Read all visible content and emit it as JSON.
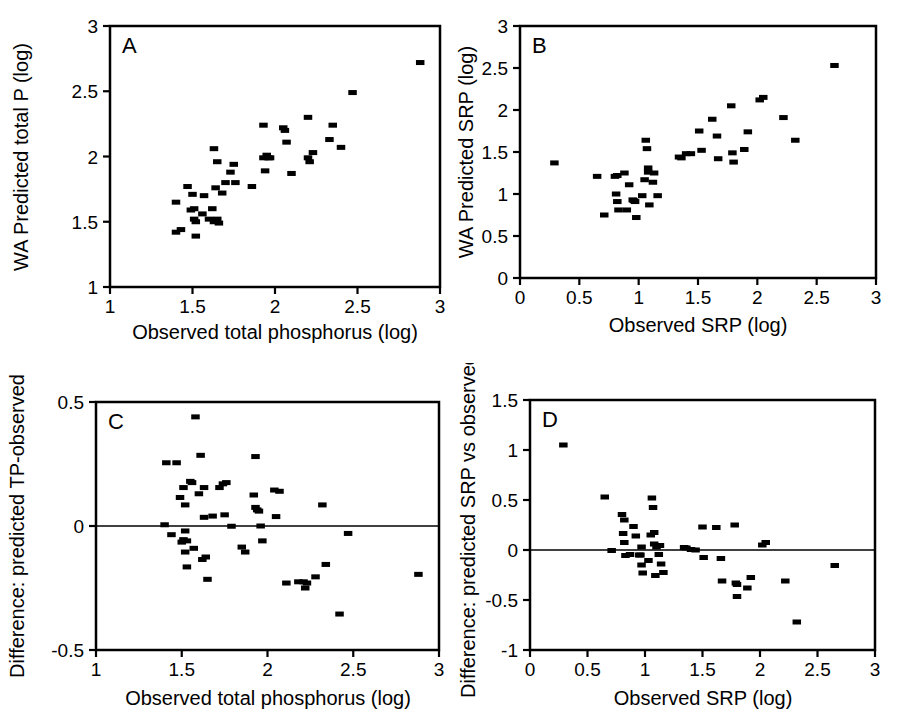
{
  "figure": {
    "background": "#ffffff",
    "ink": "#000000",
    "marker_color": "#000000",
    "panels": [
      "A",
      "B",
      "C",
      "D"
    ]
  },
  "chart_data": [
    {
      "id": "A",
      "type": "scatter",
      "panel_label": "A",
      "title": "",
      "xlabel": "Observed total phosphorus (log)",
      "ylabel": "WA Predicted total P (log)",
      "xlim": [
        1,
        3
      ],
      "ylim": [
        1,
        3
      ],
      "xticks": [
        1,
        1.5,
        2,
        2.5,
        3
      ],
      "xticklabels": [
        "1",
        "1.5",
        "2",
        "2.5",
        "3"
      ],
      "yticks": [
        1,
        1.5,
        2,
        2.5,
        3
      ],
      "yticklabels": [
        "1",
        "1.5",
        "2",
        "2.5",
        "3"
      ],
      "grid": false,
      "legend": "none",
      "reference_line": null,
      "points": [
        [
          1.4,
          1.65
        ],
        [
          1.4,
          1.42
        ],
        [
          1.43,
          1.44
        ],
        [
          1.47,
          1.77
        ],
        [
          1.49,
          1.59
        ],
        [
          1.5,
          1.71
        ],
        [
          1.51,
          1.6
        ],
        [
          1.51,
          1.52
        ],
        [
          1.52,
          1.5
        ],
        [
          1.52,
          1.39
        ],
        [
          1.56,
          1.56
        ],
        [
          1.57,
          1.7
        ],
        [
          1.6,
          1.52
        ],
        [
          1.62,
          1.6
        ],
        [
          1.63,
          2.06
        ],
        [
          1.63,
          1.5
        ],
        [
          1.64,
          1.76
        ],
        [
          1.65,
          1.96
        ],
        [
          1.65,
          1.52
        ],
        [
          1.66,
          1.49
        ],
        [
          1.68,
          1.72
        ],
        [
          1.7,
          1.8
        ],
        [
          1.73,
          1.88
        ],
        [
          1.75,
          1.94
        ],
        [
          1.76,
          1.8
        ],
        [
          1.86,
          1.77
        ],
        [
          1.93,
          2.24
        ],
        [
          1.93,
          1.99
        ],
        [
          1.94,
          1.89
        ],
        [
          1.95,
          2.01
        ],
        [
          1.96,
          1.99
        ],
        [
          1.97,
          1.99
        ],
        [
          2.05,
          2.22
        ],
        [
          2.06,
          2.2
        ],
        [
          2.07,
          2.11
        ],
        [
          2.1,
          1.87
        ],
        [
          2.2,
          2.3
        ],
        [
          2.2,
          1.99
        ],
        [
          2.21,
          1.96
        ],
        [
          2.23,
          2.03
        ],
        [
          2.33,
          2.13
        ],
        [
          2.35,
          2.24
        ],
        [
          2.4,
          2.07
        ],
        [
          2.47,
          2.49
        ],
        [
          2.88,
          2.72
        ]
      ]
    },
    {
      "id": "B",
      "type": "scatter",
      "panel_label": "B",
      "title": "",
      "xlabel": "Observed SRP (log)",
      "ylabel": "WA Predicted SRP (log)",
      "xlim": [
        0,
        3
      ],
      "ylim": [
        0,
        3
      ],
      "xticks": [
        0,
        0.5,
        1,
        1.5,
        2,
        2.5,
        3
      ],
      "xticklabels": [
        "0",
        "0.5",
        "1",
        "1.5",
        "2",
        "2.5",
        "3"
      ],
      "yticks": [
        0,
        0.5,
        1,
        1.5,
        2,
        2.5,
        3
      ],
      "yticklabels": [
        "0",
        "0.5",
        "1",
        "1.5",
        "2",
        "2.5",
        "3"
      ],
      "grid": false,
      "legend": "none",
      "reference_line": null,
      "points": [
        [
          0.29,
          1.37
        ],
        [
          0.65,
          1.21
        ],
        [
          0.71,
          0.75
        ],
        [
          0.8,
          1.21
        ],
        [
          0.81,
          1.0
        ],
        [
          0.82,
          1.22
        ],
        [
          0.82,
          0.91
        ],
        [
          0.83,
          0.81
        ],
        [
          0.88,
          1.25
        ],
        [
          0.9,
          0.81
        ],
        [
          0.92,
          1.11
        ],
        [
          0.95,
          0.93
        ],
        [
          0.96,
          0.92
        ],
        [
          0.97,
          0.91
        ],
        [
          0.98,
          0.72
        ],
        [
          1.03,
          0.98
        ],
        [
          1.05,
          1.17
        ],
        [
          1.06,
          1.64
        ],
        [
          1.07,
          1.54
        ],
        [
          1.08,
          1.31
        ],
        [
          1.08,
          1.26
        ],
        [
          1.09,
          0.87
        ],
        [
          1.12,
          1.14
        ],
        [
          1.13,
          1.25
        ],
        [
          1.16,
          0.98
        ],
        [
          1.34,
          1.44
        ],
        [
          1.36,
          1.43
        ],
        [
          1.4,
          1.48
        ],
        [
          1.44,
          1.48
        ],
        [
          1.51,
          1.75
        ],
        [
          1.53,
          1.52
        ],
        [
          1.62,
          1.89
        ],
        [
          1.66,
          1.69
        ],
        [
          1.67,
          1.42
        ],
        [
          1.78,
          2.05
        ],
        [
          1.79,
          1.49
        ],
        [
          1.8,
          1.38
        ],
        [
          1.89,
          1.53
        ],
        [
          1.92,
          1.74
        ],
        [
          2.02,
          2.12
        ],
        [
          2.05,
          2.15
        ],
        [
          2.22,
          1.91
        ],
        [
          2.32,
          1.64
        ],
        [
          2.65,
          2.53
        ]
      ]
    },
    {
      "id": "C",
      "type": "scatter",
      "panel_label": "C",
      "title": "",
      "xlabel": "Observed total phosphorus (log)",
      "ylabel": "Difference: predicted TP-observed",
      "xlim": [
        1,
        3
      ],
      "ylim": [
        -0.5,
        0.5
      ],
      "xticks": [
        1,
        1.5,
        2,
        2.5,
        3
      ],
      "xticklabels": [
        "1",
        "1.5",
        "2",
        "2.5",
        "3"
      ],
      "yticks": [
        -0.5,
        0,
        0.5
      ],
      "yticklabels": [
        "-0.5",
        "0",
        "0.5"
      ],
      "grid": false,
      "legend": "none",
      "reference_line": 0,
      "points": [
        [
          1.4,
          0.005
        ],
        [
          1.41,
          0.255
        ],
        [
          1.44,
          -0.035
        ],
        [
          1.47,
          0.255
        ],
        [
          1.49,
          0.115
        ],
        [
          1.5,
          -0.065
        ],
        [
          1.51,
          0.155
        ],
        [
          1.51,
          -0.055
        ],
        [
          1.52,
          0.085
        ],
        [
          1.52,
          -0.02
        ],
        [
          1.52,
          -0.105
        ],
        [
          1.53,
          -0.06
        ],
        [
          1.53,
          -0.165
        ],
        [
          1.55,
          0.18
        ],
        [
          1.56,
          0.175
        ],
        [
          1.57,
          -0.09
        ],
        [
          1.58,
          0.44
        ],
        [
          1.6,
          0.13
        ],
        [
          1.61,
          0.285
        ],
        [
          1.62,
          -0.135
        ],
        [
          1.63,
          0.155
        ],
        [
          1.63,
          0.035
        ],
        [
          1.64,
          -0.125
        ],
        [
          1.65,
          -0.215
        ],
        [
          1.68,
          0.04
        ],
        [
          1.72,
          0.155
        ],
        [
          1.74,
          0.17
        ],
        [
          1.75,
          0.045
        ],
        [
          1.76,
          0.175
        ],
        [
          1.79,
          -0.001
        ],
        [
          1.85,
          -0.085
        ],
        [
          1.87,
          -0.105
        ],
        [
          1.92,
          0.125
        ],
        [
          1.93,
          0.28
        ],
        [
          1.93,
          0.075
        ],
        [
          1.94,
          0.065
        ],
        [
          1.95,
          0.06
        ],
        [
          1.96,
          0.0
        ],
        [
          1.97,
          -0.06
        ],
        [
          2.04,
          0.145
        ],
        [
          2.05,
          0.038
        ],
        [
          2.07,
          0.14
        ],
        [
          2.11,
          -0.23
        ],
        [
          2.18,
          -0.225
        ],
        [
          2.21,
          -0.225
        ],
        [
          2.22,
          -0.25
        ],
        [
          2.23,
          -0.23
        ],
        [
          2.28,
          -0.205
        ],
        [
          2.32,
          0.085
        ],
        [
          2.34,
          -0.155
        ],
        [
          2.42,
          -0.355
        ],
        [
          2.47,
          -0.03
        ],
        [
          2.88,
          -0.195
        ]
      ]
    },
    {
      "id": "D",
      "type": "scatter",
      "panel_label": "D",
      "title": "",
      "xlabel": "Observed SRP (log)",
      "ylabel": "Difference: predicted SRP vs observed",
      "xlim": [
        0,
        3
      ],
      "ylim": [
        -1,
        1.5
      ],
      "xticks": [
        0,
        0.5,
        1,
        1.5,
        2,
        2.5,
        3
      ],
      "xticklabels": [
        "0",
        "0.5",
        "1",
        "1.5",
        "2",
        "2.5",
        "3"
      ],
      "yticks": [
        -1,
        -0.5,
        0,
        0.5,
        1,
        1.5
      ],
      "yticklabels": [
        "-1",
        "-0.5",
        "0",
        "0.5",
        "1",
        "1.5"
      ],
      "grid": false,
      "legend": "none",
      "reference_line": 0,
      "points": [
        [
          0.29,
          1.05
        ],
        [
          0.65,
          0.53
        ],
        [
          0.71,
          -0.005
        ],
        [
          0.8,
          0.355
        ],
        [
          0.81,
          0.165
        ],
        [
          0.82,
          0.3
        ],
        [
          0.82,
          0.075
        ],
        [
          0.83,
          -0.055
        ],
        [
          0.87,
          -0.045
        ],
        [
          0.9,
          0.235
        ],
        [
          0.92,
          0.14
        ],
        [
          0.95,
          -0.05
        ],
        [
          0.96,
          -0.05
        ],
        [
          0.97,
          0.03
        ],
        [
          0.97,
          -0.15
        ],
        [
          0.98,
          -0.23
        ],
        [
          1.03,
          -0.105
        ],
        [
          1.05,
          0.15
        ],
        [
          1.06,
          0.52
        ],
        [
          1.07,
          0.425
        ],
        [
          1.08,
          0.175
        ],
        [
          1.08,
          0.06
        ],
        [
          1.09,
          -0.255
        ],
        [
          1.1,
          0.03
        ],
        [
          1.12,
          -0.045
        ],
        [
          1.13,
          0.045
        ],
        [
          1.14,
          -0.14
        ],
        [
          1.16,
          -0.225
        ],
        [
          1.34,
          0.025
        ],
        [
          1.36,
          0.02
        ],
        [
          1.4,
          0.005
        ],
        [
          1.44,
          0.0
        ],
        [
          1.5,
          0.23
        ],
        [
          1.51,
          -0.075
        ],
        [
          1.62,
          0.225
        ],
        [
          1.66,
          -0.085
        ],
        [
          1.67,
          -0.31
        ],
        [
          1.78,
          0.25
        ],
        [
          1.79,
          -0.33
        ],
        [
          1.8,
          -0.465
        ],
        [
          1.8,
          -0.345
        ],
        [
          1.89,
          -0.38
        ],
        [
          1.92,
          -0.275
        ],
        [
          2.02,
          0.05
        ],
        [
          2.05,
          0.075
        ],
        [
          2.22,
          -0.31
        ],
        [
          2.32,
          -0.72
        ],
        [
          2.65,
          -0.155
        ]
      ]
    }
  ]
}
